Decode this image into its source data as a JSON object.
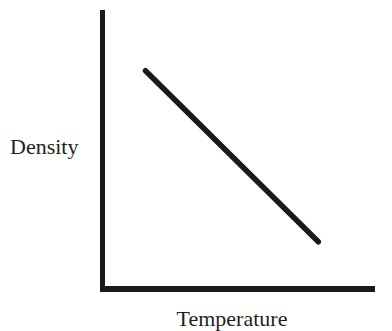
{
  "chart_data": {
    "type": "line",
    "title": "",
    "xlabel": "Temperature",
    "ylabel": "Density",
    "x_ticks": [],
    "y_ticks": [],
    "grid": false,
    "legend": null,
    "xlim": [
      0,
      1
    ],
    "ylim": [
      0,
      1
    ],
    "series": [
      {
        "name": "Density vs Temperature",
        "relationship": "negative linear",
        "x": [
          0.15,
          0.79
        ],
        "y": [
          0.78,
          0.16
        ]
      }
    ],
    "annotations": []
  },
  "colors": {
    "axis": "#1a1a1a",
    "line": "#1a1a1a",
    "background": "#ffffff"
  }
}
